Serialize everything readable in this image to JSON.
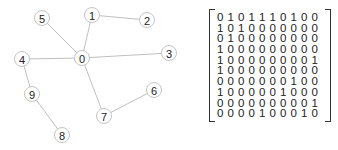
{
  "graph": {
    "nodes": [
      {
        "id": "0",
        "x": 82,
        "y": 58
      },
      {
        "id": "1",
        "x": 92,
        "y": 15
      },
      {
        "id": "2",
        "x": 147,
        "y": 20
      },
      {
        "id": "3",
        "x": 169,
        "y": 53
      },
      {
        "id": "4",
        "x": 22,
        "y": 59
      },
      {
        "id": "5",
        "x": 42,
        "y": 18
      },
      {
        "id": "6",
        "x": 154,
        "y": 90
      },
      {
        "id": "7",
        "x": 104,
        "y": 116
      },
      {
        "id": "8",
        "x": 62,
        "y": 135
      },
      {
        "id": "9",
        "x": 32,
        "y": 94
      }
    ],
    "edges": [
      [
        "0",
        "1"
      ],
      [
        "0",
        "3"
      ],
      [
        "0",
        "4"
      ],
      [
        "0",
        "5"
      ],
      [
        "0",
        "7"
      ],
      [
        "1",
        "2"
      ],
      [
        "4",
        "9"
      ],
      [
        "9",
        "8"
      ],
      [
        "7",
        "6"
      ]
    ],
    "colors": {
      "edge": "#b8b8b8",
      "node_stroke": "#c4c4c4",
      "label": "#222222"
    }
  },
  "matrix": {
    "rows": [
      [
        0,
        1,
        0,
        1,
        1,
        1,
        0,
        1,
        0,
        0
      ],
      [
        1,
        0,
        1,
        0,
        0,
        0,
        0,
        0,
        0,
        0
      ],
      [
        0,
        1,
        0,
        0,
        0,
        0,
        0,
        0,
        0,
        0
      ],
      [
        1,
        0,
        0,
        0,
        0,
        0,
        0,
        0,
        0,
        0
      ],
      [
        1,
        0,
        0,
        0,
        0,
        0,
        0,
        0,
        0,
        1
      ],
      [
        1,
        0,
        0,
        0,
        0,
        0,
        0,
        0,
        0,
        0
      ],
      [
        0,
        0,
        0,
        0,
        0,
        0,
        0,
        1,
        0,
        0
      ],
      [
        1,
        0,
        0,
        0,
        0,
        0,
        1,
        0,
        0,
        0
      ],
      [
        0,
        0,
        0,
        0,
        0,
        0,
        0,
        0,
        0,
        1
      ],
      [
        0,
        0,
        0,
        0,
        1,
        0,
        0,
        0,
        1,
        0
      ]
    ]
  }
}
